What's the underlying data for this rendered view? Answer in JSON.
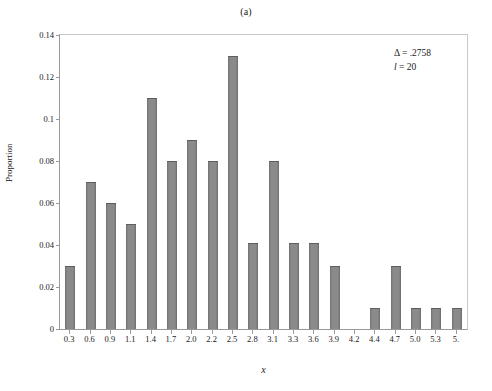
{
  "figure": {
    "panel_label": "(a)"
  },
  "annotation": {
    "delta_line": "Δ = .2758",
    "l_symbol": "l",
    "l_value": " = 20"
  },
  "chart_data": {
    "type": "bar",
    "title": "(a)",
    "xlabel": "x",
    "ylabel": "Proportion",
    "ylim": [
      0,
      0.14
    ],
    "yticks": [
      0,
      0.02,
      0.04,
      0.06,
      0.08,
      0.1,
      0.12,
      0.14
    ],
    "ytick_labels": [
      "0",
      "0.02",
      "0.04",
      "0.06",
      "0.08",
      "0.1",
      "0.12",
      "0.14"
    ],
    "grid": false,
    "legend": null,
    "bar_color": "#808080",
    "categories": [
      "0.3",
      "0.6",
      "0.9",
      "1.1",
      "1.4",
      "1.7",
      "2.0",
      "2.2",
      "2.5",
      "2.8",
      "3.1",
      "3.3",
      "3.6",
      "3.9",
      "4.2",
      "4.4",
      "4.7",
      "5.0",
      "5.3",
      "5."
    ],
    "values": [
      0.03,
      0.07,
      0.06,
      0.05,
      0.11,
      0.08,
      0.09,
      0.08,
      0.13,
      0.041,
      0.08,
      0.041,
      0.041,
      0.03,
      0,
      0.01,
      0.03,
      0.01,
      0.01,
      0.01
    ],
    "annotations": [
      "Δ = .2758",
      "l = 20"
    ]
  }
}
